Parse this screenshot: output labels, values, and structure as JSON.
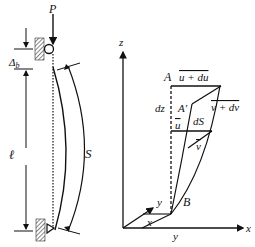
{
  "figure": {
    "left_panel": {
      "load_label": "P",
      "top_offset_label": "Δ",
      "top_offset_subscript": "b",
      "length_label": "ℓ",
      "arc_length_label": "S"
    },
    "right_panel": {
      "axes": {
        "z": "z",
        "x": "x",
        "y": "y"
      },
      "point_A": "A",
      "point_A_prime": "A′",
      "point_B": "B",
      "label_u_plus_du": "u + du",
      "label_v_plus_dv": "v + dv",
      "label_dz": "dz",
      "label_dS": "dS",
      "label_u": "u",
      "label_v": "v",
      "base_x": "x",
      "base_y": "y",
      "inner_y": "y"
    },
    "colors": {
      "ink": "#111111",
      "background": "#ffffff"
    }
  }
}
